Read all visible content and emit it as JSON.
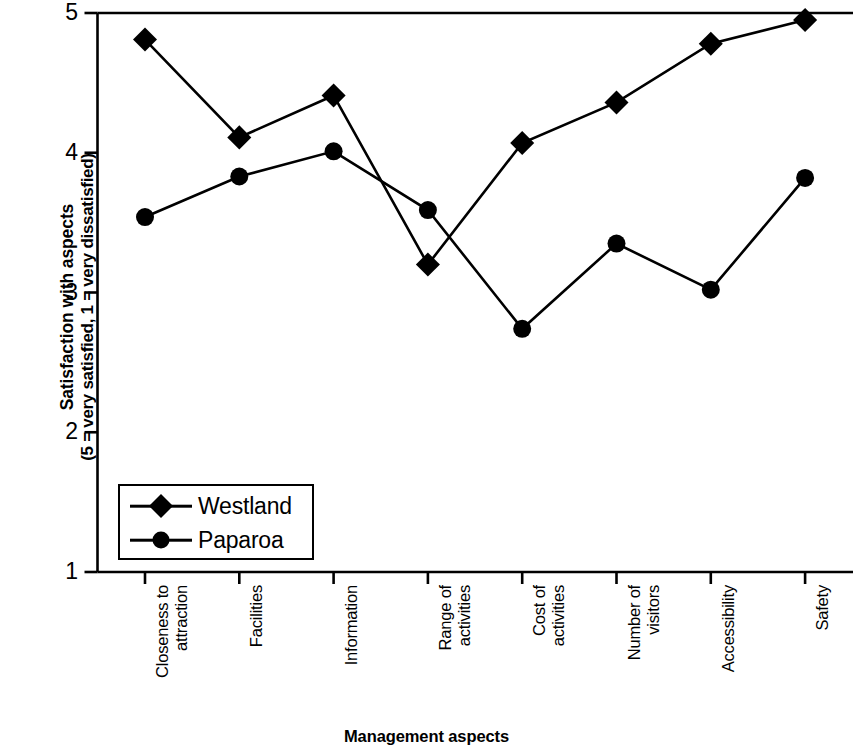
{
  "chart_data": {
    "type": "line",
    "title": "",
    "xlabel": "Management aspects",
    "ylabel": "Satisfaction with aspects",
    "ylabel_sub": "(5 = very satisfied, 1 = very dissatisfied)",
    "categories": [
      "Closeness to\nattraction",
      "Facilities",
      "Information",
      "Range of\nactivities",
      "Cost of\nactivities",
      "Number of\nvisitors",
      "Accessibility",
      "Safety"
    ],
    "ylim": [
      1,
      5
    ],
    "yticks": [
      "1",
      "2",
      "3",
      "4",
      "5"
    ],
    "grid": false,
    "legend_position": "inside-lower-left",
    "series": [
      {
        "name": "Westland",
        "marker": "diamond",
        "color": "#000000",
        "values": [
          4.81,
          4.11,
          4.41,
          3.2,
          4.07,
          4.36,
          4.78,
          4.95
        ]
      },
      {
        "name": "Paparoa",
        "marker": "circle",
        "color": "#000000",
        "values": [
          3.54,
          3.83,
          4.01,
          3.59,
          2.74,
          3.35,
          3.02,
          3.82
        ]
      }
    ]
  },
  "axes": {
    "y_title_line1": "Satisfaction with aspects",
    "y_title_line2": "(5 = very satisfied, 1 = very dissatisfied)",
    "x_title": "Management aspects"
  },
  "legend": {
    "items": [
      {
        "label": "Westland",
        "marker": "diamond"
      },
      {
        "label": "Paparoa",
        "marker": "circle"
      }
    ]
  },
  "style": {
    "ink": "#000000",
    "background": "#ffffff"
  }
}
